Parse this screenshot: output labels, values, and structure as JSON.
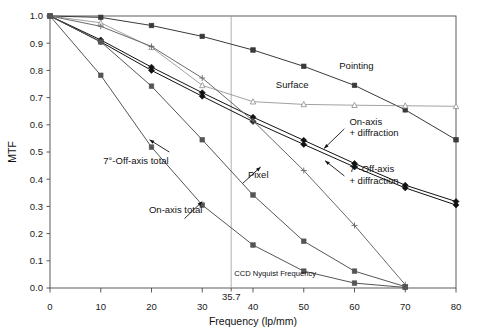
{
  "chart_data": {
    "type": "line",
    "title": "",
    "xlabel": "Frequency (lp/mm)",
    "ylabel": "MTF",
    "xlim": [
      0,
      80
    ],
    "ylim": [
      0,
      1.0
    ],
    "xticks": [
      "0",
      "10",
      "20",
      "30",
      "35.7",
      "40",
      "50",
      "60",
      "70",
      "80"
    ],
    "xtick_values": [
      0,
      10,
      20,
      30,
      35.7,
      40,
      50,
      60,
      70,
      80
    ],
    "yticks": [
      "0.0",
      "0.1",
      "0.2",
      "0.3",
      "0.4",
      "0.5",
      "0.6",
      "0.7",
      "0.8",
      "0.9",
      "1.0"
    ],
    "ytick_values": [
      0.0,
      0.1,
      0.2,
      0.3,
      0.4,
      0.5,
      0.6,
      0.7,
      0.8,
      0.9,
      1.0
    ],
    "grid": false,
    "legend": "inline-annotations",
    "annotations": [
      {
        "name": "nyquist-line-label",
        "text": "CCD Nyquist Frequency",
        "x": 35.7,
        "y": 0.045
      },
      {
        "name": "pointing-label",
        "text": "Pointing",
        "x": 57,
        "y": 0.805
      },
      {
        "name": "surface-label",
        "text": "Surface",
        "x": 44.5,
        "y": 0.735
      },
      {
        "name": "on-axis-diffraction-label",
        "text": "On-axis\n+ diffraction",
        "x": 59,
        "y": 0.6
      },
      {
        "name": "off-axis-diffraction-label",
        "text": "7°-Off-axis\n+ diffraction",
        "x": 59,
        "y": 0.425
      },
      {
        "name": "pixel-label",
        "text": "Pixel",
        "x": 39,
        "y": 0.405
      },
      {
        "name": "off-axis-total-label",
        "text": "7°-Off-axis total",
        "x": 10.5,
        "y": 0.455
      },
      {
        "name": "on-axis-total-label",
        "text": "On-axis total",
        "x": 19.5,
        "y": 0.275
      }
    ],
    "series": [
      {
        "name": "Pointing",
        "marker": "square-filled",
        "color": "#3a3a3a",
        "x": [
          0,
          10,
          20,
          30,
          40,
          50,
          60,
          70,
          80
        ],
        "values": [
          1.0,
          0.995,
          0.965,
          0.925,
          0.875,
          0.815,
          0.745,
          0.655,
          0.545
        ]
      },
      {
        "name": "Surface",
        "marker": "triangle-open",
        "color": "#8a8a8a",
        "x": [
          0,
          10,
          20,
          30,
          40,
          50,
          60,
          70,
          80
        ],
        "values": [
          1.0,
          0.975,
          0.885,
          0.745,
          0.685,
          0.675,
          0.672,
          0.67,
          0.668
        ]
      },
      {
        "name": "On-axis + diffraction",
        "marker": "diamond-filled",
        "color": "#111111",
        "x": [
          0,
          10,
          20,
          30,
          40,
          50,
          60,
          70,
          80
        ],
        "values": [
          1.0,
          0.912,
          0.812,
          0.718,
          0.628,
          0.543,
          0.458,
          0.378,
          0.318
        ]
      },
      {
        "name": "7°-Off-axis + diffraction",
        "marker": "diamond-filled",
        "color": "#111111",
        "x": [
          0,
          10,
          20,
          30,
          40,
          50,
          60,
          70,
          80
        ],
        "values": [
          1.0,
          0.905,
          0.8,
          0.705,
          0.612,
          0.528,
          0.445,
          0.368,
          0.305
        ]
      },
      {
        "name": "Pixel",
        "marker": "plus",
        "color": "#6a6a6a",
        "x": [
          0,
          10,
          20,
          30,
          40,
          50,
          60,
          70
        ],
        "values": [
          1.0,
          0.962,
          0.888,
          0.772,
          0.615,
          0.432,
          0.23,
          0.012
        ]
      },
      {
        "name": "On-axis total",
        "marker": "square-filled",
        "color": "#555555",
        "x": [
          0,
          10,
          20,
          30,
          40,
          50,
          60,
          70
        ],
        "values": [
          1.0,
          0.905,
          0.742,
          0.545,
          0.342,
          0.172,
          0.062,
          0.005
        ]
      },
      {
        "name": "7°-Off-axis total",
        "marker": "square-filled",
        "color": "#555555",
        "x": [
          0,
          10,
          20,
          30,
          40,
          50,
          60,
          70
        ],
        "values": [
          1.0,
          0.782,
          0.518,
          0.305,
          0.158,
          0.062,
          0.018,
          0.002
        ]
      }
    ]
  }
}
